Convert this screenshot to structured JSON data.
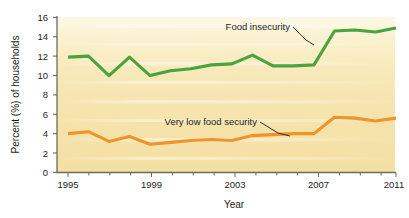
{
  "chart_data": {
    "type": "line",
    "title": "",
    "xlabel": "Year",
    "ylabel": "Percent (%) of households",
    "xlim": [
      1995,
      2011
    ],
    "ylim": [
      0,
      16
    ],
    "ytick_labels": [
      "0",
      "2",
      "4",
      "6",
      "8",
      "10",
      "12",
      "14",
      "16"
    ],
    "ytick_values": [
      0,
      2,
      4,
      6,
      8,
      10,
      12,
      14,
      16
    ],
    "xtick_labels": [
      "1995",
      "1999",
      "2003",
      "2007",
      "2011"
    ],
    "xtick_values": [
      1995,
      1999,
      2003,
      2007,
      2011
    ],
    "x": [
      1995,
      1996,
      1997,
      1998,
      1999,
      2000,
      2001,
      2002,
      2003,
      2004,
      2005,
      2006,
      2007,
      2008,
      2009,
      2010,
      2011
    ],
    "grid": "horizontal-faint",
    "legend_position": "inline-annotations",
    "plot_background": "#f7e6b4",
    "series": [
      {
        "name": "Food insecurity",
        "color": "#4aa33c",
        "values": [
          11.9,
          12.0,
          10.0,
          11.9,
          10.0,
          10.5,
          10.7,
          11.1,
          11.2,
          12.1,
          11.0,
          11.0,
          11.1,
          14.6,
          14.7,
          14.5,
          14.9
        ],
        "annotation": "Food insecurity"
      },
      {
        "name": "Very low food security",
        "color": "#f0932b",
        "values": [
          4.0,
          4.2,
          3.2,
          3.7,
          2.9,
          3.1,
          3.3,
          3.4,
          3.3,
          3.8,
          3.9,
          4.0,
          4.0,
          5.7,
          5.6,
          5.3,
          5.6
        ],
        "annotation": "Very low food security"
      }
    ]
  },
  "axes": {
    "y_title": "Percent (%) of households",
    "x_title": "Year",
    "y_ticks": [
      "16",
      "14",
      "12",
      "10",
      "8",
      "6",
      "4",
      "2",
      "0"
    ],
    "x_ticks": [
      "1995",
      "1999",
      "2003",
      "2007",
      "2011"
    ]
  },
  "annotations": {
    "food_insecurity": "Food insecurity",
    "very_low_food_security": "Very low food security"
  },
  "colors": {
    "food_insecurity": "#4aa33c",
    "very_low_food_security": "#f0932b",
    "plot_bg_top": "#fbf3d8",
    "plot_bg_bottom": "#f5e3ab",
    "axis": "#6e6a5e",
    "text": "#1d1d1b"
  }
}
